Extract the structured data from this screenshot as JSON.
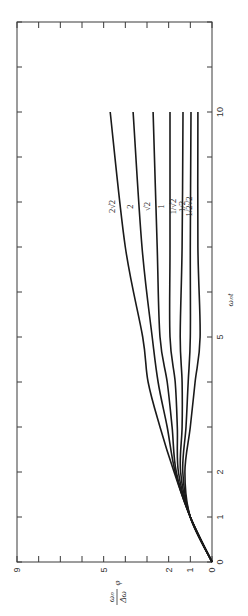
{
  "chart_data": {
    "type": "line",
    "orientation": "rotated-90-ccw",
    "title": "",
    "xlabel": "ωₙt",
    "ylabel": "ωₙ/Δω φ",
    "xlim": [
      0,
      12
    ],
    "ylim": [
      0,
      9
    ],
    "x_ticks": [
      0,
      1,
      2,
      3,
      4,
      5,
      6,
      7,
      8,
      9,
      10,
      11,
      12
    ],
    "x_tick_labels": {
      "0": "0",
      "1": "1",
      "2": "2",
      "5": "5",
      "10": "10"
    },
    "y_ticks": [
      0,
      1,
      2,
      3,
      4,
      5,
      6,
      7,
      8,
      9
    ],
    "y_tick_labels": {
      "0": "0",
      "1": "1",
      "2": "2",
      "5": "5",
      "9": "9"
    },
    "grid": false,
    "legend": "inline labels near ωₙt ≈ 8",
    "x": [
      0,
      1,
      2,
      3,
      4,
      5,
      7,
      10
    ],
    "series": [
      {
        "name": "2√2",
        "values": [
          0,
          1.0,
          1.75,
          2.4,
          2.95,
          3.2,
          4.0,
          4.7
        ]
      },
      {
        "name": "2",
        "values": [
          0,
          1.0,
          1.7,
          2.07,
          2.49,
          2.76,
          3.23,
          3.64
        ]
      },
      {
        "name": "√2",
        "values": [
          0,
          1.0,
          1.65,
          1.84,
          2.07,
          2.4,
          2.53,
          2.72
        ]
      },
      {
        "name": "1",
        "values": [
          0,
          1.0,
          1.55,
          1.6,
          1.7,
          1.94,
          1.94,
          1.94
        ]
      },
      {
        "name": "1/√2",
        "values": [
          0,
          1.0,
          1.45,
          1.38,
          1.38,
          1.47,
          1.38,
          1.34
        ]
      },
      {
        "name": "1/2",
        "values": [
          0,
          1.0,
          1.35,
          1.2,
          1.1,
          1.0,
          1.0,
          0.97
        ]
      },
      {
        "name": "1/2√2",
        "values": [
          0,
          1.0,
          1.25,
          1.0,
          0.78,
          0.55,
          0.65,
          0.65
        ]
      }
    ]
  },
  "labels": {
    "xlabel": "ωₙt",
    "ylabel_num": "ωₙ",
    "ylabel_den": "Δω",
    "ylabel_var": "φ"
  }
}
